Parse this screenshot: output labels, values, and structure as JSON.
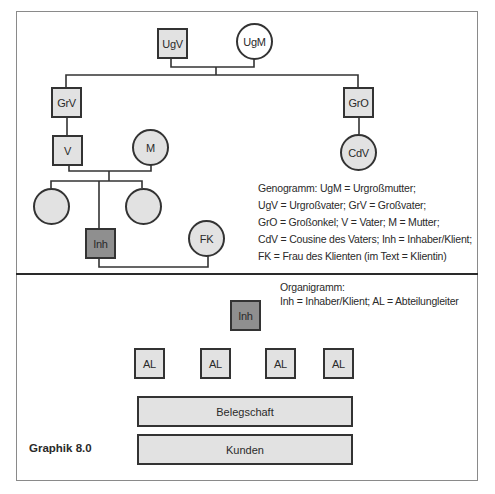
{
  "genogram": {
    "nodes": {
      "ugv": "UgV",
      "ugm": "UgM",
      "grv": "GrV",
      "gro": "GrO",
      "v": "V",
      "m": "M",
      "cdv": "CdV",
      "sibling_left": "",
      "sibling_right": "",
      "inh": "Inh",
      "fk": "FK"
    },
    "legend": [
      "Genogramm: UgM = Urgroßmutter;",
      "UgV = Urgroßvater; GrV = Großvater;",
      "GrO = Großonkel; V = Vater; M = Mutter;",
      "CdV = Cousine des Vaters; Inh = Inhaber/Klient;",
      "FK = Frau des Klienten (im Text = Klientin)"
    ]
  },
  "organigram": {
    "legend": [
      "Organigramm:",
      "Inh = Inhaber/Klient; AL = Abteilungleiter"
    ],
    "owner": "Inh",
    "department_heads": [
      "AL",
      "AL",
      "AL",
      "AL"
    ],
    "staff": "Belegschaft",
    "customers": "Kunden"
  },
  "caption": "Graphik 8.0",
  "colors": {
    "node_fill": "#e2e2e2",
    "highlight_fill": "#8f8f8f",
    "stroke": "#333333"
  }
}
